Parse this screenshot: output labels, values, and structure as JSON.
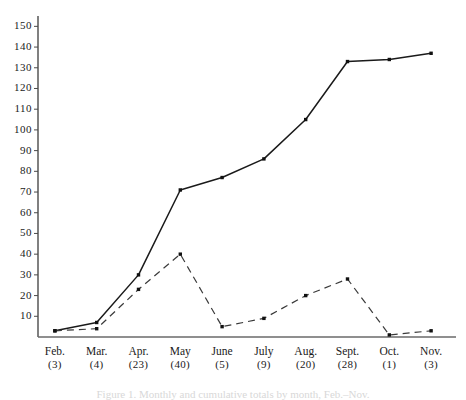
{
  "chart_data": {
    "type": "line",
    "title": "",
    "subtitle": "",
    "xlabel": "",
    "ylabel": "",
    "ylim": [
      0,
      155
    ],
    "yticks": [
      10,
      20,
      30,
      40,
      50,
      60,
      70,
      80,
      90,
      100,
      110,
      120,
      130,
      140,
      150
    ],
    "ytick_labels": [
      "10",
      "20",
      "30",
      "40",
      "50",
      "60",
      "70",
      "80",
      "90",
      "100",
      "110",
      "120",
      "130",
      "140",
      "150"
    ],
    "grid": false,
    "legend": "none",
    "categories": [
      "Feb.",
      "Mar.",
      "Apr.",
      "May",
      "June",
      "July",
      "Aug.",
      "Sept.",
      "Oct.",
      "Nov."
    ],
    "category_sublabels": [
      "(3)",
      "(4)",
      "(23)",
      "(40)",
      "(5)",
      "(9)",
      "(20)",
      "(28)",
      "(1)",
      "(3)"
    ],
    "series": [
      {
        "name": "cumulative-total",
        "style": "solid",
        "marker": "square-dot",
        "color": "#1a1a1a",
        "values": [
          3,
          7,
          30,
          71,
          77,
          86,
          105,
          133,
          134,
          137
        ]
      },
      {
        "name": "monthly-count",
        "style": "dashed",
        "marker": "square-dot",
        "color": "#3a3a3a",
        "values": [
          3,
          4,
          23,
          40,
          5,
          9,
          20,
          28,
          1,
          3
        ]
      }
    ],
    "annotations": []
  },
  "caption": {
    "partial_text": "Figure 1. Monthly and cumulative totals by month, Feb.–Nov."
  },
  "axis": {
    "y_axis_name": "y-axis",
    "x_axis_name": "x-axis"
  }
}
